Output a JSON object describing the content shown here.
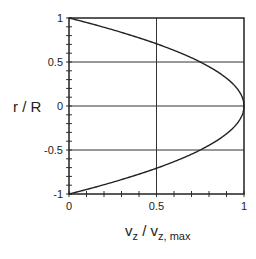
{
  "chart_data": {
    "type": "line",
    "title": "",
    "xlabel": "v_z / v_z, max",
    "xlabel_parts": {
      "main1": "v",
      "sub1": "z",
      "slash": " / ",
      "main2": "v",
      "sub2": "z, max"
    },
    "ylabel": "r / R",
    "xlim": [
      0,
      1
    ],
    "ylim": [
      -1,
      1
    ],
    "x_ticks": [
      0,
      0.5,
      1
    ],
    "x_tick_labels": [
      "0",
      "0.5",
      "1"
    ],
    "y_ticks": [
      1,
      0.5,
      0,
      -0.5,
      -1
    ],
    "y_tick_labels": [
      "1",
      "0.5",
      "0",
      "-0.5",
      "-1"
    ],
    "minor_tick_step": 0.1,
    "grid": {
      "x": [
        0.5
      ],
      "y": [
        0.5,
        0,
        -0.5
      ]
    },
    "legend": null,
    "series": [
      {
        "name": "velocity profile",
        "description": "parabolic laminar profile v_z/v_z,max = 1 - (r/R)^2",
        "color": "#222222",
        "x": [
          0.0,
          0.19,
          0.36,
          0.51,
          0.64,
          0.75,
          0.84,
          0.91,
          0.96,
          0.99,
          1.0,
          0.99,
          0.96,
          0.91,
          0.84,
          0.75,
          0.64,
          0.51,
          0.36,
          0.19,
          0.0
        ],
        "y": [
          1.0,
          0.9,
          0.8,
          0.7,
          0.6,
          0.5,
          0.4,
          0.3,
          0.2,
          0.1,
          0.0,
          -0.1,
          -0.2,
          -0.3,
          -0.4,
          -0.5,
          -0.6,
          -0.7,
          -0.8,
          -0.9,
          -1.0
        ]
      }
    ]
  }
}
